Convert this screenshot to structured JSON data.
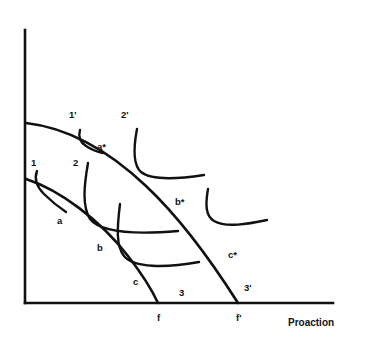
{
  "figure": {
    "type": "diagram",
    "title": "",
    "background_color": "#ffffff",
    "stroke_color": "#111111",
    "axes": {
      "x_axis": {
        "label": "Proaction",
        "label_position": {
          "x": 288,
          "y": 318
        },
        "start": {
          "x": 25,
          "y": 303
        },
        "end": {
          "x": 333,
          "y": 303
        },
        "ticks": []
      },
      "y_axis": {
        "label": "",
        "start": {
          "x": 25,
          "y": 303
        },
        "end": {
          "x": 25,
          "y": 30
        },
        "ticks": []
      }
    },
    "x_intercept_labels": [
      {
        "text": "f",
        "x": 157,
        "y": 313
      },
      {
        "text": "f'",
        "x": 236,
        "y": 313
      }
    ],
    "curve_labels": [
      {
        "text": "1",
        "x": 31,
        "y": 158
      },
      {
        "text": "2",
        "x": 73,
        "y": 158
      },
      {
        "text": "3",
        "x": 179,
        "y": 288
      },
      {
        "text": "1'",
        "x": 69,
        "y": 110
      },
      {
        "text": "2'",
        "x": 121,
        "y": 110
      },
      {
        "text": "3'",
        "x": 244,
        "y": 283
      }
    ],
    "tangency_labels": [
      {
        "text": "a",
        "x": 57,
        "y": 216
      },
      {
        "text": "b",
        "x": 97,
        "y": 243
      },
      {
        "text": "c",
        "x": 133,
        "y": 277
      },
      {
        "text": "a*",
        "x": 97,
        "y": 142
      },
      {
        "text": "b*",
        "x": 175,
        "y": 197
      },
      {
        "text": "c*",
        "x": 228,
        "y": 250
      }
    ],
    "curves": {
      "transformation_lower": {
        "name": "lower-transformation-curve",
        "path": "M 26,179 C 60,190 100,220 128,256 C 142,274 152,290 158,303",
        "stroke_width": 2.6
      },
      "transformation_upper": {
        "name": "upper-transformation-curve",
        "path": "M 26,123 C 70,128 110,152 146,186 C 180,218 212,262 238,303",
        "stroke_width": 2.6
      },
      "indifference_1": {
        "name": "indifference-curve-1",
        "path": "M 37,171 C 34,179 36,186 44,194 C 52,202 60,208 66,212",
        "stroke_width": 2.4
      },
      "indifference_2": {
        "name": "indifference-curve-2",
        "path": "M 88,163 C 84,186 82,206 90,219 C 100,232 130,235 178,231",
        "stroke_width": 2.4
      },
      "indifference_3": {
        "name": "indifference-curve-3",
        "path": "M 120,204 C 117,228 116,246 124,256 C 134,268 165,268 199,262",
        "stroke_width": 2.4
      },
      "indifference_1p": {
        "name": "indifference-curve-1-prime",
        "path": "M 80,130 C 78,137 80,142 86,146 C 92,150 98,152 103,153",
        "stroke_width": 2.4
      },
      "indifference_2p": {
        "name": "indifference-curve-2-prime",
        "path": "M 137,129 C 133,150 133,165 141,172 C 152,181 178,179 204,175",
        "stroke_width": 2.4
      },
      "indifference_3p": {
        "name": "indifference-curve-3-prime",
        "path": "M 208,189 C 205,206 206,216 214,221 C 226,228 248,224 267,220",
        "stroke_width": 2.4
      }
    }
  }
}
